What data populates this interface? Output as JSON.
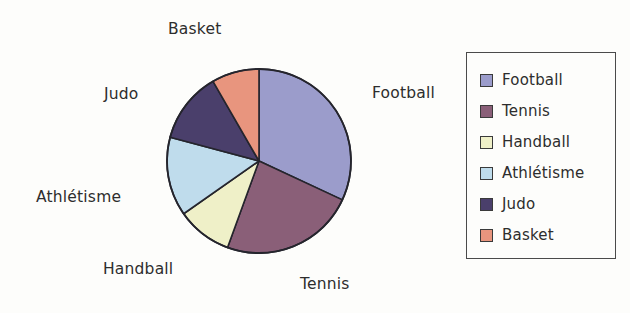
{
  "chart_data": {
    "type": "pie",
    "title": "",
    "categories": [
      "Football",
      "Tennis",
      "Handball",
      "Athlétisme",
      "Judo",
      "Basket"
    ],
    "values": [
      32,
      23.6,
      9.7,
      13.9,
      12.5,
      8.3
    ],
    "units": "percent",
    "start_angle_deg": 0,
    "direction": "clockwise",
    "legend_position": "right",
    "grid": false,
    "slices": [
      {
        "label": "Football",
        "value": 32,
        "angle_deg": 115,
        "color": "#9b9ccb",
        "start_deg": 0,
        "end_deg": 115
      },
      {
        "label": "Tennis",
        "value": 23.6,
        "angle_deg": 85,
        "color": "#8a5f78",
        "start_deg": 115,
        "end_deg": 200
      },
      {
        "label": "Handball",
        "value": 9.7,
        "angle_deg": 35,
        "color": "#eff0c8",
        "start_deg": 200,
        "end_deg": 235
      },
      {
        "label": "Athlétisme",
        "value": 13.9,
        "angle_deg": 50,
        "color": "#bfdcec",
        "start_deg": 235,
        "end_deg": 285
      },
      {
        "label": "Judo",
        "value": 12.5,
        "angle_deg": 45,
        "color": "#4a3f6b",
        "start_deg": 285,
        "end_deg": 330
      },
      {
        "label": "Basket",
        "value": 8.3,
        "angle_deg": 30,
        "color": "#e8957e",
        "start_deg": 330,
        "end_deg": 360
      }
    ]
  },
  "callouts": {
    "football": "Football",
    "tennis": "Tennis",
    "handball": "Handball",
    "athletisme": "Athlétisme",
    "judo": "Judo",
    "basket": "Basket"
  },
  "legend": {
    "items": [
      {
        "label": "Football",
        "color": "#9b9ccb"
      },
      {
        "label": "Tennis",
        "color": "#8a5f78"
      },
      {
        "label": "Handball",
        "color": "#eff0c8"
      },
      {
        "label": "Athlétisme",
        "color": "#bfdcec"
      },
      {
        "label": "Judo",
        "color": "#4a3f6b"
      },
      {
        "label": "Basket",
        "color": "#e8957e"
      }
    ]
  },
  "style": {
    "slice_outline": "#25252d",
    "text_color": "#2d2d2d",
    "legend_border": "#4a4a4a",
    "background": "#fdfdfb"
  }
}
